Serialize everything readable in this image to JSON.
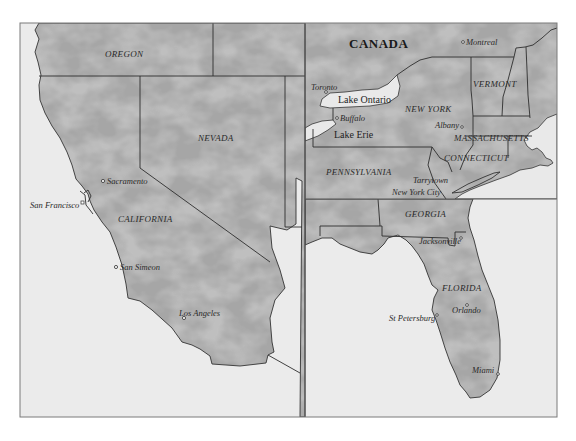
{
  "map": {
    "colors": {
      "page_bg": "#ffffff",
      "sea": "#ebebeb",
      "land": "#a8a8a8",
      "land_vein": "#d6d6d6",
      "border": "#2e2e2e",
      "frame": "#6e6e6e"
    },
    "panels": {
      "west": {
        "states": [
          "OREGON",
          "NEVADA",
          "CALIFORNIA"
        ],
        "cities": [
          "Sacramento",
          "San Francisco",
          "San Simeon",
          "Los Angeles"
        ]
      },
      "northeast": {
        "country": "CANADA",
        "states": [
          "VERMONT",
          "NEW YORK",
          "MASSACHUSETTS",
          "CONNECTICUT",
          "PENNSYLVANIA"
        ],
        "cities": [
          "Montreal",
          "Toronto",
          "Buffalo",
          "Albany",
          "Tarrytown",
          "New York City"
        ],
        "lakes": [
          "Lake Ontario",
          "Lake Erie"
        ]
      },
      "southeast": {
        "states": [
          "GEORGIA",
          "FLORIDA"
        ],
        "cities": [
          "Jacksonville",
          "St Petersburg",
          "Orlando",
          "Miami"
        ]
      }
    }
  }
}
